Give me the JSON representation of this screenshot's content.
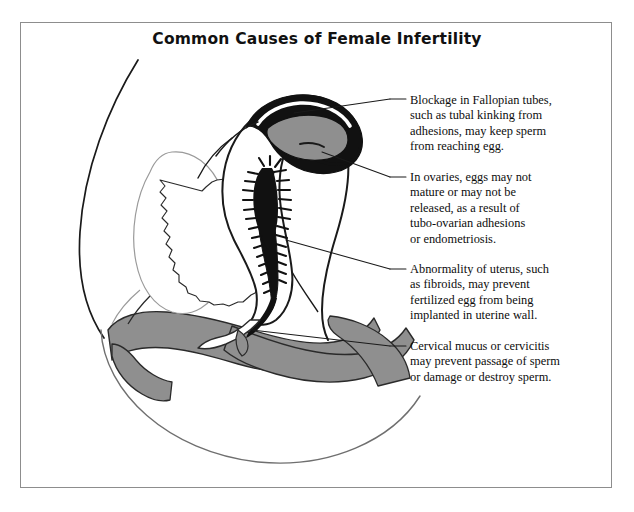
{
  "document": {
    "title": "Common Causes of Female Infertility",
    "frame_border_color": "#8d8d8d",
    "background_color": "#ffffff",
    "text_color": "#0d0d0d"
  },
  "illustration": {
    "name": "sagittal-cross-section-female-reproductive-anatomy",
    "palette": {
      "outline": "#1a1a1a",
      "fill_white": "#ffffff",
      "fill_gray": "#8f8f8f",
      "fill_dark_gray": "#7b7b7b",
      "fill_black": "#111111",
      "faint_line": "#9a9a9a"
    },
    "parts": [
      {
        "name": "abdominal-wall-outline",
        "fill": "#ffffff"
      },
      {
        "name": "bladder",
        "fill": "#ffffff"
      },
      {
        "name": "bladder-lining",
        "fill": "#ffffff"
      },
      {
        "name": "uterus-body",
        "fill": "#ffffff"
      },
      {
        "name": "uterine-cavity-endometrium",
        "fill": "#111111"
      },
      {
        "name": "cervical-canal",
        "fill": "#111111"
      },
      {
        "name": "fallopian-tube",
        "fill": "#111111"
      },
      {
        "name": "ovary",
        "fill": "#8f8f8f"
      },
      {
        "name": "vagina",
        "fill": "#8f8f8f"
      },
      {
        "name": "rectum",
        "fill": "#8f8f8f"
      },
      {
        "name": "pelvic-floor",
        "fill": "#8f8f8f"
      }
    ]
  },
  "callouts": [
    {
      "id": "fallopian-tubes",
      "lines": [
        "Blockage in Fallopian tubes,",
        "such as tubal kinking from",
        "adhesions, may keep sperm",
        "from reaching egg."
      ]
    },
    {
      "id": "ovaries",
      "lines": [
        "In ovaries, eggs may not",
        "mature or may not be",
        "released, as a result of",
        "tubo-ovarian adhesions",
        "or endometriosis."
      ]
    },
    {
      "id": "uterus",
      "lines": [
        "Abnormality of uterus, such",
        "as fibroids, may prevent",
        "fertilized egg from being",
        "implanted in uterine wall."
      ]
    },
    {
      "id": "cervix",
      "lines": [
        "Cervical mucus or cervicitis",
        "may prevent passage of sperm",
        "or damage or destroy sperm."
      ]
    }
  ]
}
